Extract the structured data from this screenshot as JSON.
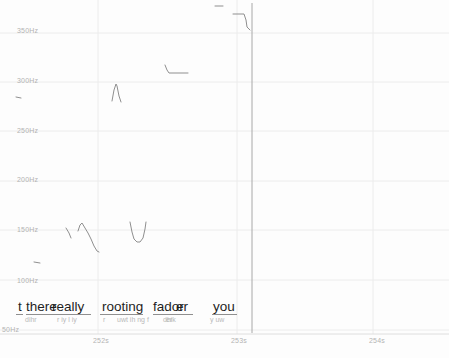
{
  "app": {
    "view_name": "pitch-contour-editor"
  },
  "colors": {
    "background": "#fdfdfd",
    "gridline": "#ececec",
    "baseline": "#dedede",
    "pitch_contour": "#8f8f8f",
    "cursor": "#a8a8a8",
    "axis_label": "#b3b3b3",
    "word_text": "#1f1f1f",
    "phone_text": "#b9b9b9",
    "underline": "#8f8f8f"
  },
  "chart_data": {
    "type": "line",
    "xlabel": "Time (s)",
    "ylabel": "Frequency (Hz)",
    "grid": true,
    "legend": "none",
    "ylim_hz": [
      50,
      380
    ],
    "xlim_s": [
      251.3,
      254.5
    ],
    "yticks": [
      {
        "label": "350Hz",
        "hz": 350,
        "y": 33,
        "label_x": 17,
        "label_y": 31
      },
      {
        "label": "300Hz",
        "hz": 300,
        "y": 82,
        "label_x": 17,
        "label_y": 81
      },
      {
        "label": "250Hz",
        "hz": 250,
        "y": 131,
        "label_x": 17,
        "label_y": 131
      },
      {
        "label": "200Hz",
        "hz": 200,
        "y": 181,
        "label_x": 17,
        "label_y": 180
      },
      {
        "label": "150Hz",
        "hz": 150,
        "y": 230,
        "label_x": 17,
        "label_y": 230
      },
      {
        "label": "100Hz",
        "hz": 100,
        "y": 280,
        "label_x": 17,
        "label_y": 281
      },
      {
        "label": "50Hz",
        "hz": 50,
        "y": 330,
        "label_x": 2,
        "label_y": 330
      }
    ],
    "xticks": [
      {
        "label": "252s",
        "t": 252,
        "x": 98,
        "label_x": 102,
        "label_y": 340
      },
      {
        "label": "253s",
        "t": 253,
        "x": 237,
        "label_x": 240,
        "label_y": 340
      },
      {
        "label": "254s",
        "t": 254,
        "x": 373,
        "label_x": 378,
        "label_y": 340
      }
    ],
    "baseline_y": 334,
    "cursor": {
      "x": 252,
      "y1": 3,
      "y2": 333
    },
    "series": [
      {
        "name": "pitch-segment-1",
        "approx": {
          "t_start": 253.35,
          "t_end": 253.41,
          "hz_start": 378,
          "hz_end": 378,
          "shape": "flat dash"
        },
        "points_px": [
          [
            215,
            6
          ],
          [
            223,
            6
          ]
        ]
      },
      {
        "name": "pitch-segment-2",
        "approx": {
          "t_start": 252.98,
          "t_end": 253.1,
          "hz_start": 369,
          "hz_end": 353,
          "shape": "level then falling step"
        },
        "points_px": [
          [
            233,
            14
          ],
          [
            244,
            14
          ],
          [
            246,
            20
          ],
          [
            247,
            27
          ],
          [
            250,
            30
          ]
        ]
      },
      {
        "name": "pitch-segment-3",
        "approx": {
          "t_start": 252.49,
          "t_end": 252.65,
          "hz_start": 317,
          "hz_end": 309,
          "shape": "small drop then level"
        },
        "points_px": [
          [
            165,
            65
          ],
          [
            167,
            70
          ],
          [
            169,
            73
          ],
          [
            188,
            73
          ]
        ]
      },
      {
        "name": "pitch-segment-4",
        "approx": {
          "t_start": 252.1,
          "t_end": 252.17,
          "hz_start": 281,
          "hz_peak": 298,
          "hz_end": 280,
          "shape": "narrow peak"
        },
        "points_px": [
          [
            112,
            101
          ],
          [
            114,
            90
          ],
          [
            116,
            84
          ],
          [
            117,
            86
          ],
          [
            119,
            96
          ],
          [
            121,
            102
          ]
        ]
      },
      {
        "name": "pitch-segment-5",
        "approx": {
          "t_start": 251.4,
          "t_end": 251.44,
          "hz_start": 285,
          "hz_end": 284,
          "shape": "flat dash"
        },
        "points_px": [
          [
            16,
            97
          ],
          [
            21,
            98
          ]
        ]
      },
      {
        "name": "pitch-segment-6",
        "approx": {
          "t_start": 251.77,
          "t_end": 251.8,
          "hz_start": 151,
          "hz_end": 141,
          "shape": "short fall"
        },
        "points_px": [
          [
            66,
            228
          ],
          [
            69,
            233
          ],
          [
            71,
            238
          ]
        ]
      },
      {
        "name": "pitch-segment-7",
        "approx": {
          "t_start": 251.85,
          "t_end": 252.01,
          "hz_start": 154,
          "hz_peak": 156,
          "hz_end": 127,
          "shape": "rise then long fall"
        },
        "points_px": [
          [
            78,
            231
          ],
          [
            80,
            225
          ],
          [
            82,
            223
          ],
          [
            85,
            228
          ],
          [
            88,
            233
          ],
          [
            91,
            239
          ],
          [
            94,
            246
          ],
          [
            97,
            251
          ],
          [
            99,
            252
          ]
        ]
      },
      {
        "name": "pitch-segment-8",
        "approx": {
          "t_start": 252.23,
          "t_end": 252.35,
          "hz_start": 157,
          "hz_min": 137,
          "hz_end": 157,
          "shape": "u-shaped dip"
        },
        "points_px": [
          [
            130,
            222
          ],
          [
            132,
            232
          ],
          [
            134,
            239
          ],
          [
            137,
            242
          ],
          [
            140,
            242
          ],
          [
            143,
            238
          ],
          [
            145,
            229
          ],
          [
            146,
            222
          ]
        ]
      },
      {
        "name": "pitch-segment-9",
        "approx": {
          "t_start": 251.53,
          "t_end": 251.58,
          "hz_start": 116,
          "hz_end": 116,
          "shape": "flat dash"
        },
        "points_px": [
          [
            34,
            262
          ],
          [
            40,
            263
          ]
        ]
      }
    ]
  },
  "transcript": {
    "words_y": 299,
    "words": [
      {
        "text": "t",
        "x": 18
      },
      {
        "text": "there",
        "x": 26
      },
      {
        "text": "really",
        "x": 52
      },
      {
        "text": "rooting",
        "x": 102
      },
      {
        "text": "fador",
        "x": 153
      },
      {
        "text": "er",
        "x": 176
      },
      {
        "text": "you",
        "x": 213
      }
    ],
    "underline_y": 314,
    "underlines": [
      {
        "x1": 16,
        "x2": 23
      },
      {
        "x1": 26,
        "x2": 91
      },
      {
        "x1": 100,
        "x2": 143
      },
      {
        "x1": 153,
        "x2": 193
      },
      {
        "x1": 212,
        "x2": 237
      }
    ],
    "phones_y": 316,
    "phones": [
      {
        "text": "dihr",
        "x": 25
      },
      {
        "text": "r iy l iy",
        "x": 57
      },
      {
        "text": "r",
        "x": 103
      },
      {
        "text": "uwt ih ng f",
        "x": 117
      },
      {
        "text": "dhik",
        "x": 163
      },
      {
        "text": "er",
        "x": 166
      },
      {
        "text": "y uw",
        "x": 210
      }
    ]
  }
}
